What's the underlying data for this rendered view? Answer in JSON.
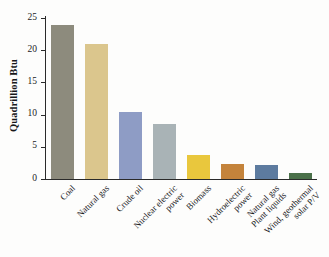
{
  "chart_data": {
    "type": "bar",
    "title": "",
    "xlabel": "",
    "ylabel": "Quadrillion Btu",
    "ylim": [
      0,
      25
    ],
    "yticks": [
      0,
      5,
      10,
      15,
      20,
      25
    ],
    "ytick_labels": [
      "0",
      "5",
      "10",
      "15",
      "20",
      "25"
    ],
    "grid": false,
    "legend": "none",
    "categories": [
      "Coal",
      "Natural gas",
      "Crude oil",
      "Nuclear electric power",
      "Biomass",
      "Hydroelectric power",
      "Natural gas Plant liquids",
      "Wind, geothermal solar P/V"
    ],
    "category_lines": [
      [
        "Coal"
      ],
      [
        "Natural gas"
      ],
      [
        "Crude oil"
      ],
      [
        "Nuclear electric",
        "power"
      ],
      [
        "Biomass"
      ],
      [
        "Hydroelectric",
        "power"
      ],
      [
        "Natural gas",
        "Plant liquids"
      ],
      [
        "Wind, geothermal",
        "solar P/V"
      ]
    ],
    "values": [
      23.9,
      21.0,
      10.4,
      8.5,
      3.7,
      2.3,
      2.2,
      0.9
    ],
    "colors": [
      "#8d8b7d",
      "#dbc68d",
      "#8e9cc5",
      "#a9b3b6",
      "#e9c73d",
      "#c4833b",
      "#5d7b9f",
      "#4a7049"
    ]
  },
  "axis": {
    "line_color": "#2a2a2a"
  }
}
